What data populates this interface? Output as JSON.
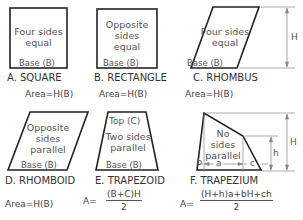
{
  "shapes": [
    {
      "id": "A",
      "label": "A. SQUARE",
      "inner": [
        "Four sides",
        "equal"
      ],
      "base": "Base (B)",
      "area": "Area=H(B)"
    },
    {
      "id": "B",
      "label": "B. RECTANGLE",
      "inner": [
        "Opposite",
        "sides",
        "equal"
      ],
      "base": "Base (B)",
      "area": "Area=H(B)"
    },
    {
      "id": "C",
      "label": "C. RHOMBUS",
      "inner": [
        "Four sides",
        "equal"
      ],
      "base": "Base (B)",
      "area": "Area=H(B)",
      "dimension": "H"
    },
    {
      "id": "D",
      "label": "D. RHOMBOID",
      "inner": [
        "Opposite",
        "sides",
        "parallel"
      ],
      "base": "Base (B)",
      "area": "Area=H(B)"
    },
    {
      "id": "E",
      "label": "E. TRAPEZOID",
      "top": "Top (C)",
      "inner": [
        "Two sides",
        "parallel"
      ],
      "base": "Base (B)",
      "area_prefix": "A=",
      "area_num": "(B+C)H",
      "area_den": "2"
    },
    {
      "id": "F",
      "label": "F. TRAPEZIUM",
      "inner": [
        "No",
        "sides",
        "parallel"
      ],
      "dims": {
        "b": "b",
        "a": "a",
        "c": "c",
        "H": "H",
        "h": "h"
      },
      "area_prefix": "A=",
      "area_num": "(H+h)a+bH+ch",
      "area_den": "2"
    }
  ],
  "colors": {
    "line": "#222222",
    "text": "#444444",
    "dimline": "#777777"
  }
}
